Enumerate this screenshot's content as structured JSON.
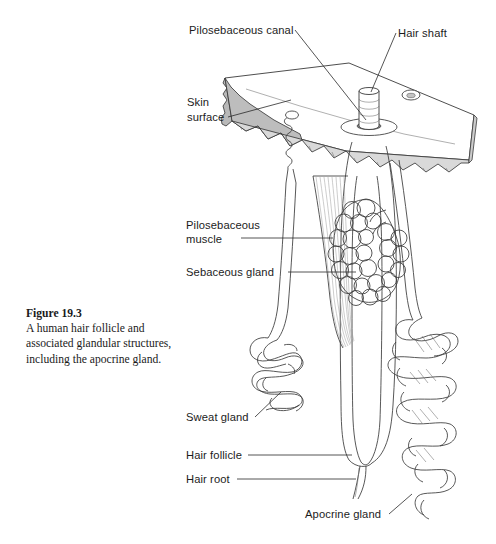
{
  "figure": {
    "caption_title": "Figure 19.3",
    "caption_body": "A human hair follicle and associated glandular structures, including the apocrine gland."
  },
  "labels": [
    {
      "id": "pilosebaceous-canal",
      "text": "Pilosebaceous canal"
    },
    {
      "id": "hair-shaft",
      "text": "Hair shaft"
    },
    {
      "id": "skin-surface-line1",
      "text": "Skin"
    },
    {
      "id": "skin-surface-line2",
      "text": "surface"
    },
    {
      "id": "pilosebaceous-muscle-line1",
      "text": "Pilosebaceous"
    },
    {
      "id": "pilosebaceous-muscle-line2",
      "text": "muscle"
    },
    {
      "id": "sebaceous-gland",
      "text": "Sebaceous gland"
    },
    {
      "id": "sweat-gland",
      "text": "Sweat gland"
    },
    {
      "id": "hair-follicle",
      "text": "Hair follicle"
    },
    {
      "id": "hair-root",
      "text": "Hair root"
    },
    {
      "id": "apocrine-gland",
      "text": "Apocrine gland"
    }
  ],
  "colors": {
    "background": "#ffffff",
    "ink": "#1c1c1c",
    "outline": "#3a3a3a",
    "skin_cut_face": "#b9b9b9",
    "skin_band": "#d9d9d9",
    "skin_top": "#ffffff",
    "pore_shadow": "#9a9a9a"
  },
  "structures": [
    {
      "id": "skin-slab",
      "name": "skin-slab"
    },
    {
      "id": "hair-shaft-cylinder",
      "name": "hair-shaft-cylinder"
    },
    {
      "id": "surface-pore",
      "name": "surface-pore"
    },
    {
      "id": "pilosebaceous-canal-duct",
      "name": "pilosebaceous-canal-duct"
    },
    {
      "id": "arrector-muscle",
      "name": "arrector-pili-muscle"
    },
    {
      "id": "sebaceous-cluster",
      "name": "sebaceous-gland-cluster"
    },
    {
      "id": "follicle-shaft",
      "name": "hair-follicle-shaft"
    },
    {
      "id": "hair-root-tail",
      "name": "hair-root-tail"
    },
    {
      "id": "sweat-gland-coil",
      "name": "sweat-gland-coil"
    },
    {
      "id": "apocrine-gland-coil",
      "name": "apocrine-gland-coil"
    }
  ]
}
